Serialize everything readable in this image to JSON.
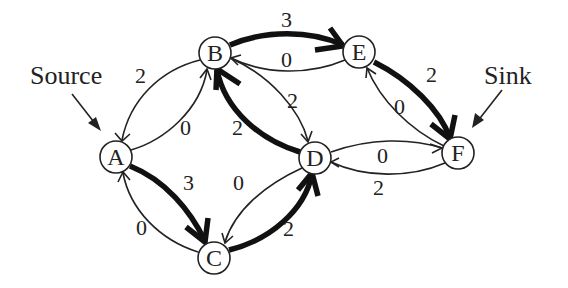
{
  "diagram": {
    "type": "flow-network",
    "callouts": {
      "source": "Source",
      "sink": "Sink"
    },
    "nodes": [
      {
        "id": "A",
        "label": "A",
        "x": 116,
        "y": 157
      },
      {
        "id": "B",
        "label": "B",
        "x": 215,
        "y": 53
      },
      {
        "id": "C",
        "label": "C",
        "x": 214,
        "y": 258
      },
      {
        "id": "D",
        "label": "D",
        "x": 315,
        "y": 158
      },
      {
        "id": "E",
        "label": "E",
        "x": 359,
        "y": 52
      },
      {
        "id": "F",
        "label": "F",
        "x": 458,
        "y": 153
      }
    ],
    "edges": [
      {
        "from": "B",
        "to": "A",
        "label": "2",
        "style": "thin"
      },
      {
        "from": "A",
        "to": "B",
        "label": "0",
        "style": "thin"
      },
      {
        "from": "A",
        "to": "C",
        "label": "3",
        "style": "thick"
      },
      {
        "from": "C",
        "to": "A",
        "label": "0",
        "style": "thin"
      },
      {
        "from": "B",
        "to": "E",
        "label": "3",
        "style": "thick"
      },
      {
        "from": "E",
        "to": "B",
        "label": "0",
        "style": "thin"
      },
      {
        "from": "B",
        "to": "D",
        "label": "2",
        "style": "thin"
      },
      {
        "from": "D",
        "to": "B",
        "label": "2",
        "style": "thick"
      },
      {
        "from": "D",
        "to": "C",
        "label": "0",
        "style": "thin"
      },
      {
        "from": "C",
        "to": "D",
        "label": "2",
        "style": "thick"
      },
      {
        "from": "E",
        "to": "F",
        "label": "2",
        "style": "thick"
      },
      {
        "from": "F",
        "to": "E",
        "label": "0",
        "style": "thin"
      },
      {
        "from": "D",
        "to": "F",
        "label": "0",
        "style": "thin"
      },
      {
        "from": "F",
        "to": "D",
        "label": "2",
        "style": "thin"
      }
    ]
  }
}
